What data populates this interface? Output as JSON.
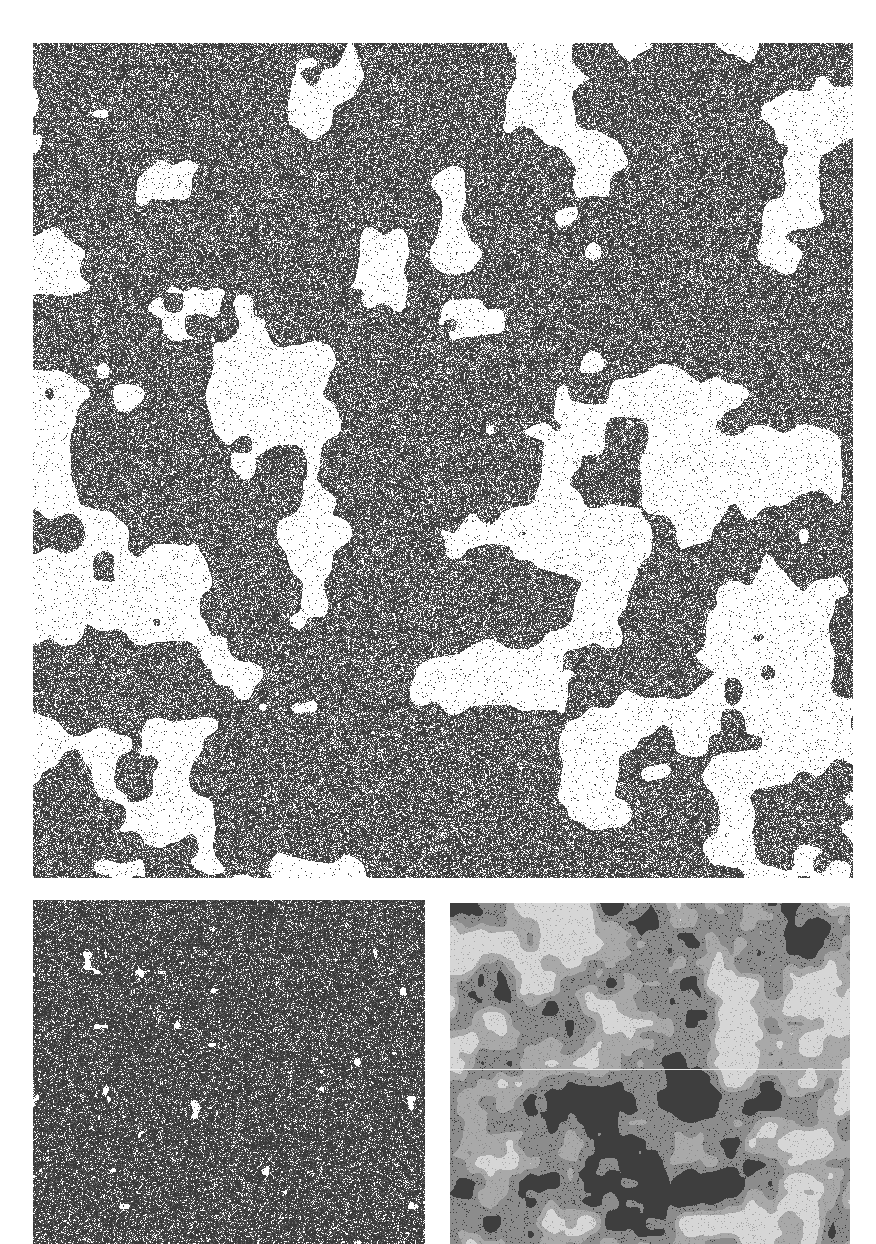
{
  "figure": {
    "background": "#ffffff",
    "panels": [
      {
        "id": "top",
        "description": "percolation cluster near critical threshold",
        "x": 33,
        "y": 43,
        "w": 820,
        "h": 835,
        "style": "binary",
        "occupied_color": "#3a3a3a",
        "empty_color": "#ffffff",
        "density": 0.62,
        "void_scale": 70,
        "void_threshold": 0.58,
        "seed": 7
      },
      {
        "id": "bottom-left",
        "description": "dense percolation cluster above threshold",
        "x": 33,
        "y": 900,
        "w": 392,
        "h": 344,
        "style": "binary",
        "occupied_color": "#3a3a3a",
        "empty_color": "#ffffff",
        "density": 0.72,
        "void_scale": 18,
        "void_threshold": 0.8,
        "seed": 13
      },
      {
        "id": "bottom-right",
        "description": "multi-phase grayscale domain texture",
        "x": 450,
        "y": 903,
        "w": 400,
        "h": 341,
        "style": "gray",
        "levels": [
          "#d6d6d6",
          "#a9a9a9",
          "#8c8c8c",
          "#3e3e3e"
        ],
        "void_scale": 40,
        "seed": 21,
        "seam_y": 166
      }
    ]
  }
}
